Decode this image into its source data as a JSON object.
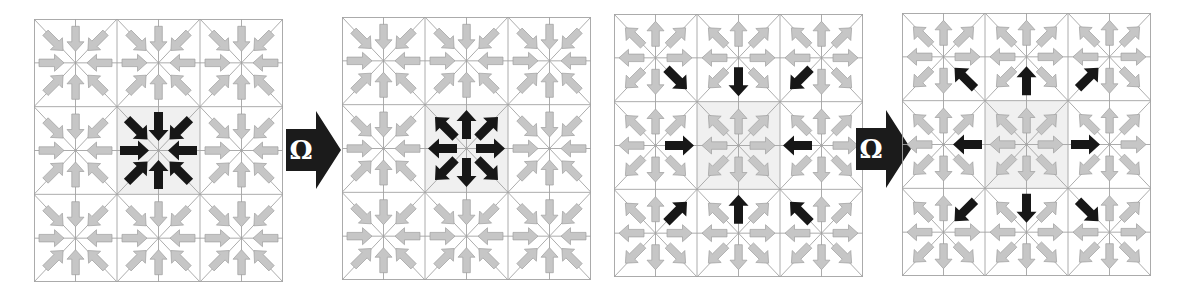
{
  "figure_type": "lattice-collision-diagram",
  "colors": {
    "background": "#ffffff",
    "grid_line": "#a3a3a3",
    "arrow_gray_fill": "#c6c6c6",
    "arrow_gray_stroke": "#9e9e9e",
    "arrow_black": "#171717",
    "cell_highlight": "#f0f0f0",
    "omega_fill": "#1b1b1b",
    "omega_text_color": "#ffffff"
  },
  "operators": [
    {
      "label": "Ω"
    },
    {
      "label": "Ω"
    }
  ],
  "panels": [
    {
      "id": "pair1-before",
      "grid": {
        "rows": 3,
        "cols": 3
      },
      "background_arrows": "inward",
      "highlight": {
        "node": "center",
        "arrows": "inward"
      },
      "center_cell_shaded": true
    },
    {
      "id": "pair1-after",
      "grid": {
        "rows": 3,
        "cols": 3
      },
      "background_arrows": "inward",
      "highlight": {
        "node": "center",
        "arrows": "outward"
      },
      "center_cell_shaded": true
    },
    {
      "id": "pair2-before",
      "grid": {
        "rows": 3,
        "cols": 3
      },
      "background_arrows": "outward",
      "highlight": {
        "node": "center-neighbors",
        "arrows": "toward-center"
      },
      "center_cell_shaded": true
    },
    {
      "id": "pair2-after",
      "grid": {
        "rows": 3,
        "cols": 3
      },
      "background_arrows": "outward",
      "highlight": {
        "node": "center-neighbors",
        "arrows": "away-from-center"
      },
      "center_cell_shaded": true
    }
  ]
}
